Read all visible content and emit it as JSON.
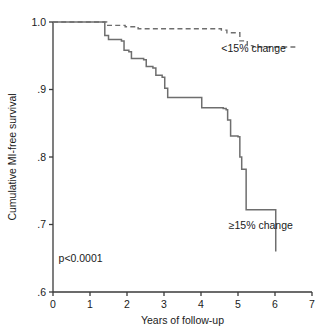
{
  "chart_data": {
    "type": "line",
    "title": "",
    "subtitle": "",
    "xlabel": "Years of follow-up",
    "ylabel": "Cumulative MI-free survival",
    "xlim": [
      0,
      7
    ],
    "ylim": [
      0.6,
      1.0
    ],
    "xticks": [
      "0",
      "1",
      "2",
      "3",
      "4",
      "5",
      "6",
      "7"
    ],
    "xtick_values": [
      0,
      1,
      2,
      3,
      4,
      5,
      6,
      7
    ],
    "yticks": [
      "1.0",
      ".9",
      ".8",
      ".7",
      ".6"
    ],
    "ytick_values": [
      1.0,
      0.9,
      0.8,
      0.7,
      0.6
    ],
    "grid": false,
    "legend_position": "inline-annotation",
    "annotations": [
      {
        "name": "p-value",
        "text": "p<0.0001",
        "x": 0.15,
        "y": 0.645
      },
      {
        "name": "series-label-dashed",
        "text": "<15% change",
        "x": 4.55,
        "y": 0.955
      },
      {
        "name": "series-label-solid",
        "text": "≥15% change",
        "x": 4.75,
        "y": 0.693
      }
    ],
    "series": [
      {
        "name": "<15% change",
        "style": "dashed",
        "color": "#6e6e6e",
        "step": "post",
        "points": [
          {
            "x": 0.0,
            "y": 1.0
          },
          {
            "x": 1.0,
            "y": 1.0
          },
          {
            "x": 1.45,
            "y": 0.995
          },
          {
            "x": 1.95,
            "y": 0.993
          },
          {
            "x": 2.3,
            "y": 0.99
          },
          {
            "x": 4.55,
            "y": 0.988
          },
          {
            "x": 4.7,
            "y": 0.984
          },
          {
            "x": 5.05,
            "y": 0.972
          },
          {
            "x": 5.25,
            "y": 0.965
          },
          {
            "x": 5.4,
            "y": 0.963
          },
          {
            "x": 6.55,
            "y": 0.963
          }
        ]
      },
      {
        "name": "≥15% change",
        "style": "solid",
        "color": "#6e6e6e",
        "step": "post",
        "points": [
          {
            "x": 0.0,
            "y": 1.0
          },
          {
            "x": 1.05,
            "y": 1.0
          },
          {
            "x": 1.4,
            "y": 0.98
          },
          {
            "x": 1.5,
            "y": 0.974
          },
          {
            "x": 1.85,
            "y": 0.972
          },
          {
            "x": 1.92,
            "y": 0.958
          },
          {
            "x": 2.05,
            "y": 0.956
          },
          {
            "x": 2.12,
            "y": 0.946
          },
          {
            "x": 2.45,
            "y": 0.944
          },
          {
            "x": 2.52,
            "y": 0.934
          },
          {
            "x": 2.7,
            "y": 0.932
          },
          {
            "x": 2.78,
            "y": 0.921
          },
          {
            "x": 2.95,
            "y": 0.918
          },
          {
            "x": 3.02,
            "y": 0.902
          },
          {
            "x": 3.1,
            "y": 0.888
          },
          {
            "x": 3.95,
            "y": 0.888
          },
          {
            "x": 4.02,
            "y": 0.873
          },
          {
            "x": 4.6,
            "y": 0.872
          },
          {
            "x": 4.68,
            "y": 0.87
          },
          {
            "x": 4.72,
            "y": 0.855
          },
          {
            "x": 4.8,
            "y": 0.831
          },
          {
            "x": 5.0,
            "y": 0.83
          },
          {
            "x": 5.05,
            "y": 0.8
          },
          {
            "x": 5.1,
            "y": 0.782
          },
          {
            "x": 5.22,
            "y": 0.722
          },
          {
            "x": 6.0,
            "y": 0.722
          },
          {
            "x": 6.02,
            "y": 0.66
          }
        ]
      }
    ]
  }
}
